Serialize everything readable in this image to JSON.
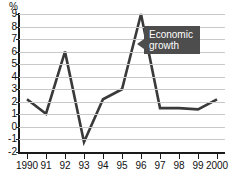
{
  "chart_data": {
    "type": "line",
    "title": "",
    "subtitle": "",
    "xlabel": "",
    "ylabel": "",
    "unit_label": "%",
    "categories": [
      "1990",
      "91",
      "92",
      "93",
      "94",
      "95",
      "96",
      "97",
      "98",
      "99",
      "2000"
    ],
    "x": [
      1990,
      1991,
      1992,
      1993,
      1994,
      1995,
      1996,
      1997,
      1998,
      1999,
      2000
    ],
    "values": [
      2.2,
      1.05,
      6.0,
      -1.2,
      2.2,
      3.0,
      9.0,
      1.5,
      1.5,
      1.4,
      2.2
    ],
    "series": [
      {
        "name": "Economic growth",
        "values": [
          2.2,
          1.05,
          6.0,
          -1.2,
          2.2,
          3.0,
          9.0,
          1.5,
          1.5,
          1.4,
          2.2
        ]
      }
    ],
    "ylim": [
      -2,
      9
    ],
    "yticks": [
      9,
      8,
      7,
      6,
      5,
      4,
      3,
      2,
      1,
      0,
      -1,
      -2
    ],
    "ytick_labels": [
      "9",
      "8",
      "7",
      "6",
      "5",
      "4",
      "3",
      "2",
      "1",
      "0",
      "-1",
      "-2"
    ],
    "grid": true,
    "grid_axis": "y",
    "legend": false,
    "legend_position": "none",
    "annotations": [
      {
        "name": "economic-growth-callout",
        "lines": [
          "Economic",
          "growth"
        ],
        "text": "Economic growth",
        "points_to_year": 1996,
        "points_to_value": 7.2
      }
    ],
    "colors": {
      "line": "#3a3a3a",
      "grid": "#c9c9c9",
      "axis": "#1a1a1a",
      "background": "#ffffff",
      "callout_background": "#4d4d4d",
      "callout_text": "#ffffff",
      "tick_text": "#111111"
    }
  }
}
